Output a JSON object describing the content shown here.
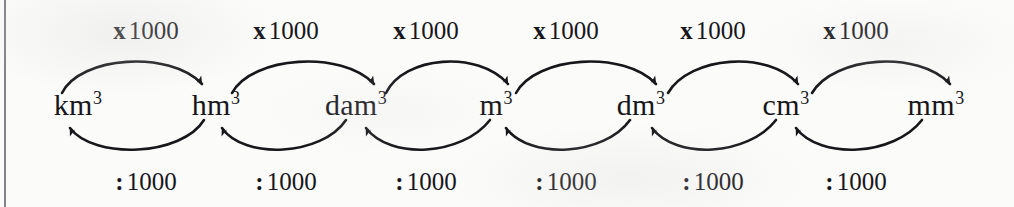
{
  "diagram": {
    "ink_color": "#17161a",
    "background_color": "#fbfbfa",
    "edge_rule_color": "#6d6f72",
    "units": [
      {
        "base": "km",
        "exponent": "3",
        "x": 78
      },
      {
        "base": "hm",
        "exponent": "3",
        "x": 216
      },
      {
        "base": "dam",
        "exponent": "3",
        "x": 356
      },
      {
        "base": "m",
        "exponent": "3",
        "x": 496
      },
      {
        "base": "dm",
        "exponent": "3",
        "x": 641
      },
      {
        "base": "cm",
        "exponent": "3",
        "x": 786
      },
      {
        "base": "mm",
        "exponent": "3",
        "x": 936
      }
    ],
    "unit_y": 105,
    "multiply": {
      "symbol": "x",
      "value": "1000",
      "y": 30,
      "positions": [
        146,
        286,
        426,
        566,
        713,
        856
      ]
    },
    "divide": {
      "symbol": ":",
      "value": "1000",
      "y": 181,
      "positions": [
        146,
        286,
        426,
        566,
        713,
        856
      ]
    }
  }
}
